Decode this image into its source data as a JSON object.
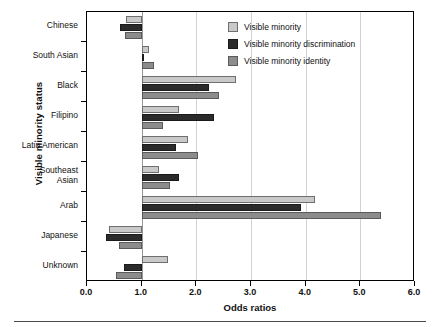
{
  "chart_data": {
    "type": "bar",
    "orientation": "horizontal",
    "title": "",
    "xlabel": "Odds ratios",
    "ylabel": "Visible minority status",
    "xlim": [
      0.0,
      6.0
    ],
    "xticks": [
      "0.0",
      "1.0",
      "2.0",
      "3.0",
      "4.0",
      "5.0",
      "6.0"
    ],
    "xtick_values": [
      0.0,
      1.0,
      2.0,
      3.0,
      4.0,
      5.0,
      6.0
    ],
    "grid": "vertical",
    "reference_line": 1.0,
    "legend_position": "top-right",
    "categories": [
      "Chinese",
      "South Asian",
      "Black",
      "Filipino",
      "Latin American",
      "Southeast Asian",
      "Arab",
      "Japanese",
      "Unknown"
    ],
    "series": [
      {
        "name": "Visible minority",
        "color": "#c9c9c9",
        "values": [
          0.72,
          1.13,
          2.73,
          1.68,
          1.85,
          1.31,
          4.17,
          0.4,
          1.48
        ]
      },
      {
        "name": "Visible minority discrimination",
        "color": "#2b2b2b",
        "values": [
          0.6,
          1.02,
          2.23,
          2.32,
          1.63,
          1.68,
          3.91,
          0.35,
          0.68
        ]
      },
      {
        "name": "Visible minority identity",
        "color": "#8c8c8c",
        "values": [
          0.7,
          1.22,
          2.41,
          1.39,
          2.03,
          1.52,
          5.37,
          0.58,
          0.53
        ]
      }
    ]
  },
  "legend": {
    "items": [
      {
        "label": "Visible minority",
        "swatch_class": "sw-light"
      },
      {
        "label": "Visible minority discrimination",
        "swatch_class": "sw-dark"
      },
      {
        "label": "Visible minority identity",
        "swatch_class": "sw-medium"
      }
    ]
  }
}
